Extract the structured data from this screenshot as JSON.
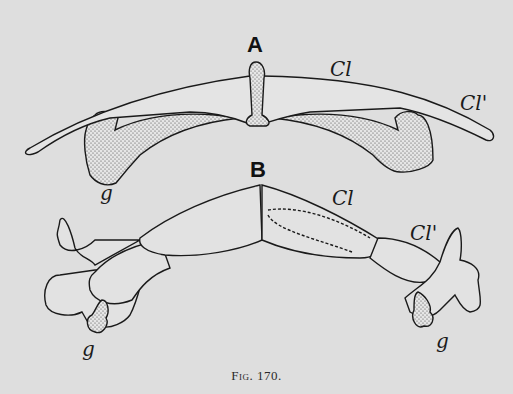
{
  "figure": {
    "caption": "Fig. 170.",
    "panels": [
      {
        "id": "A",
        "labels": [
          "Cl",
          "Cl'",
          "g"
        ]
      },
      {
        "id": "B",
        "labels": [
          "Cl",
          "Cl'",
          "g",
          "g"
        ]
      }
    ]
  },
  "labels": {
    "panel_a": "A",
    "panel_b": "B",
    "a_cl": "Cl",
    "a_cl_prime": "Cl'",
    "a_g": "g",
    "b_cl": "Cl",
    "b_cl_prime": "Cl'",
    "b_g_left": "g",
    "b_g_right": "g"
  },
  "colors": {
    "background": "#dedede",
    "ink": "#1a1a1a",
    "stipple": "#bdbdbd"
  }
}
